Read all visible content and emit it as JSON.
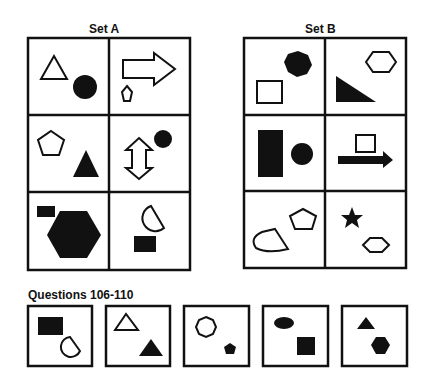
{
  "set_a": {
    "title": "Set A",
    "cells": [
      {
        "position": "top-left",
        "shapes": [
          "outline triangle",
          "filled circle"
        ]
      },
      {
        "position": "top-right",
        "shapes": [
          "outline right arrow",
          "small outline pentagon"
        ]
      },
      {
        "position": "middle-left",
        "shapes": [
          "outline pentagon",
          "filled triangle"
        ]
      },
      {
        "position": "middle-right",
        "shapes": [
          "outline double vertical arrow",
          "filled circle"
        ]
      },
      {
        "position": "bottom-left",
        "shapes": [
          "small filled rectangle",
          "large filled hexagon"
        ]
      },
      {
        "position": "bottom-right",
        "shapes": [
          "outline semicircle",
          "filled rectangle"
        ]
      }
    ]
  },
  "set_b": {
    "title": "Set B",
    "cells": [
      {
        "position": "top-left",
        "shapes": [
          "filled heptagon",
          "outline rectangle"
        ]
      },
      {
        "position": "top-right",
        "shapes": [
          "outline hexagon",
          "filled right triangle"
        ]
      },
      {
        "position": "middle-left",
        "shapes": [
          "filled tall rectangle",
          "filled circle"
        ]
      },
      {
        "position": "middle-right",
        "shapes": [
          "outline square",
          "filled right arrow"
        ]
      },
      {
        "position": "bottom-left",
        "shapes": [
          "outline pentagon",
          "outline fan shape"
        ]
      },
      {
        "position": "bottom-right",
        "shapes": [
          "filled star",
          "outline hexagon"
        ]
      }
    ]
  },
  "questions": {
    "title": "Questions 106-110",
    "items": [
      {
        "number": 106,
        "shapes": [
          "filled rectangle",
          "outline semicircle"
        ]
      },
      {
        "number": 107,
        "shapes": [
          "outline triangle",
          "filled triangle"
        ]
      },
      {
        "number": 108,
        "shapes": [
          "outline heptagon",
          "filled pentagon"
        ]
      },
      {
        "number": 109,
        "shapes": [
          "filled ellipse",
          "filled square"
        ]
      },
      {
        "number": 110,
        "shapes": [
          "filled triangle",
          "filled hexagon"
        ]
      }
    ]
  }
}
